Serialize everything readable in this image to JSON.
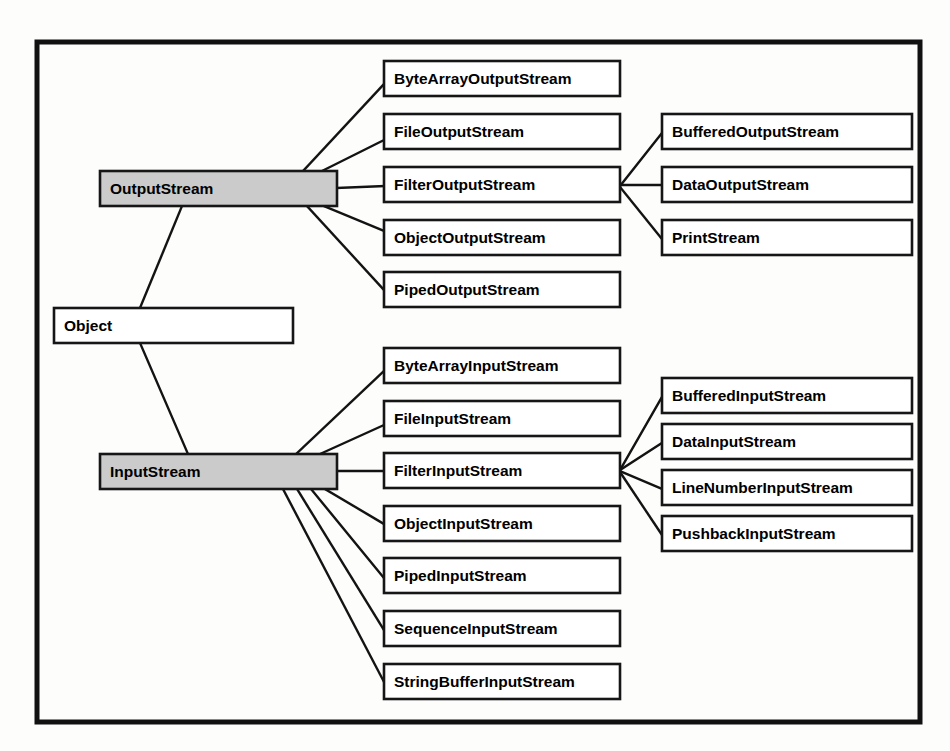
{
  "diagram": {
    "frame": {
      "x": 37,
      "y": 42,
      "width": 883,
      "height": 680
    },
    "colors": {
      "background": "#fdfdfc",
      "frame_border": "#111111",
      "node_border": "#161616",
      "node_fill": "#ffffff",
      "highlight_fill": "#cbcbcb",
      "edge": "#131313",
      "text": "#000000"
    },
    "nodes": [
      {
        "id": "object",
        "label": "Object",
        "x": 54,
        "y": 308,
        "w": 239,
        "h": 35,
        "highlight": false
      },
      {
        "id": "output_stream",
        "label": "OutputStream",
        "x": 100,
        "y": 171,
        "w": 237,
        "h": 35,
        "highlight": true
      },
      {
        "id": "input_stream",
        "label": "InputStream",
        "x": 100,
        "y": 454,
        "w": 237,
        "h": 35,
        "highlight": true
      },
      {
        "id": "byte_array_output_stream",
        "label": "ByteArrayOutputStream",
        "x": 384,
        "y": 61,
        "w": 236,
        "h": 35,
        "highlight": false
      },
      {
        "id": "file_output_stream",
        "label": "FileOutputStream",
        "x": 384,
        "y": 114,
        "w": 236,
        "h": 35,
        "highlight": false
      },
      {
        "id": "filter_output_stream",
        "label": "FilterOutputStream",
        "x": 384,
        "y": 167,
        "w": 236,
        "h": 35,
        "highlight": false
      },
      {
        "id": "object_output_stream",
        "label": "ObjectOutputStream",
        "x": 384,
        "y": 220,
        "w": 236,
        "h": 35,
        "highlight": false
      },
      {
        "id": "piped_output_stream",
        "label": "PipedOutputStream",
        "x": 384,
        "y": 272,
        "w": 236,
        "h": 35,
        "highlight": false
      },
      {
        "id": "buffered_output_stream",
        "label": "BufferedOutputStream",
        "x": 662,
        "y": 114,
        "w": 250,
        "h": 35,
        "highlight": false
      },
      {
        "id": "data_output_stream",
        "label": "DataOutputStream",
        "x": 662,
        "y": 167,
        "w": 250,
        "h": 35,
        "highlight": false
      },
      {
        "id": "print_stream",
        "label": "PrintStream",
        "x": 662,
        "y": 220,
        "w": 250,
        "h": 35,
        "highlight": false
      },
      {
        "id": "byte_array_input_stream",
        "label": "ByteArrayInputStream",
        "x": 384,
        "y": 348,
        "w": 236,
        "h": 35,
        "highlight": false
      },
      {
        "id": "file_input_stream",
        "label": "FileInputStream",
        "x": 384,
        "y": 401,
        "w": 236,
        "h": 35,
        "highlight": false
      },
      {
        "id": "filter_input_stream",
        "label": "FilterInputStream",
        "x": 384,
        "y": 453,
        "w": 236,
        "h": 35,
        "highlight": false
      },
      {
        "id": "object_input_stream",
        "label": "ObjectInputStream",
        "x": 384,
        "y": 506,
        "w": 236,
        "h": 35,
        "highlight": false
      },
      {
        "id": "piped_input_stream",
        "label": "PipedInputStream",
        "x": 384,
        "y": 558,
        "w": 236,
        "h": 35,
        "highlight": false
      },
      {
        "id": "sequence_input_stream",
        "label": "SequenceInputStream",
        "x": 384,
        "y": 611,
        "w": 236,
        "h": 35,
        "highlight": false
      },
      {
        "id": "string_buffer_input_stream",
        "label": "StringBufferInputStream",
        "x": 384,
        "y": 664,
        "w": 236,
        "h": 35,
        "highlight": false
      },
      {
        "id": "buffered_input_stream",
        "label": "BufferedInputStream",
        "x": 662,
        "y": 378,
        "w": 250,
        "h": 35,
        "highlight": false
      },
      {
        "id": "data_input_stream",
        "label": "DataInputStream",
        "x": 662,
        "y": 424,
        "w": 250,
        "h": 35,
        "highlight": false
      },
      {
        "id": "line_number_input_stream",
        "label": "LineNumberInputStream",
        "x": 662,
        "y": 470,
        "w": 250,
        "h": 35,
        "highlight": false
      },
      {
        "id": "pushback_input_stream",
        "label": "PushbackInputStream",
        "x": 662,
        "y": 516,
        "w": 250,
        "h": 35,
        "highlight": false
      }
    ],
    "edges": [
      {
        "id": "object-output_stream",
        "from": "object",
        "to": "output_stream",
        "x1": 140,
        "y1": 308,
        "x2": 182,
        "y2": 206
      },
      {
        "id": "object-input_stream",
        "from": "object",
        "to": "input_stream",
        "x1": 140,
        "y1": 343,
        "x2": 188,
        "y2": 454
      },
      {
        "id": "output_stream-byte_array_output_stream",
        "from": "output_stream",
        "to": "byte_array_output_stream",
        "x1": 303,
        "y1": 171,
        "x2": 384,
        "y2": 84
      },
      {
        "id": "output_stream-file_output_stream",
        "from": "output_stream",
        "to": "file_output_stream",
        "x1": 322,
        "y1": 171,
        "x2": 384,
        "y2": 140
      },
      {
        "id": "output_stream-filter_output_stream",
        "from": "output_stream",
        "to": "filter_output_stream",
        "x1": 337,
        "y1": 188,
        "x2": 384,
        "y2": 186
      },
      {
        "id": "output_stream-object_output_stream",
        "from": "output_stream",
        "to": "object_output_stream",
        "x1": 324,
        "y1": 206,
        "x2": 384,
        "y2": 231
      },
      {
        "id": "output_stream-piped_output_stream",
        "from": "output_stream",
        "to": "piped_output_stream",
        "x1": 307,
        "y1": 206,
        "x2": 384,
        "y2": 290
      },
      {
        "id": "filter_output_stream-buffered_output_stream",
        "from": "filter_output_stream",
        "to": "buffered_output_stream",
        "x1": 620,
        "y1": 186,
        "x2": 662,
        "y2": 133
      },
      {
        "id": "filter_output_stream-data_output_stream",
        "from": "filter_output_stream",
        "to": "data_output_stream",
        "x1": 620,
        "y1": 185,
        "x2": 662,
        "y2": 185
      },
      {
        "id": "filter_output_stream-print_stream",
        "from": "filter_output_stream",
        "to": "print_stream",
        "x1": 620,
        "y1": 187,
        "x2": 662,
        "y2": 239
      },
      {
        "id": "input_stream-byte_array_input_stream",
        "from": "input_stream",
        "to": "byte_array_input_stream",
        "x1": 296,
        "y1": 454,
        "x2": 384,
        "y2": 371
      },
      {
        "id": "input_stream-file_input_stream",
        "from": "input_stream",
        "to": "file_input_stream",
        "x1": 320,
        "y1": 454,
        "x2": 384,
        "y2": 425
      },
      {
        "id": "input_stream-filter_input_stream",
        "from": "input_stream",
        "to": "filter_input_stream",
        "x1": 337,
        "y1": 471,
        "x2": 384,
        "y2": 471
      },
      {
        "id": "input_stream-object_input_stream",
        "from": "input_stream",
        "to": "object_input_stream",
        "x1": 325,
        "y1": 489,
        "x2": 384,
        "y2": 524
      },
      {
        "id": "input_stream-piped_input_stream",
        "from": "input_stream",
        "to": "piped_input_stream",
        "x1": 311,
        "y1": 489,
        "x2": 384,
        "y2": 578
      },
      {
        "id": "input_stream-sequence_input_stream",
        "from": "input_stream",
        "to": "sequence_input_stream",
        "x1": 297,
        "y1": 489,
        "x2": 384,
        "y2": 630
      },
      {
        "id": "input_stream-string_buffer_input_stream",
        "from": "input_stream",
        "to": "string_buffer_input_stream",
        "x1": 283,
        "y1": 489,
        "x2": 384,
        "y2": 682
      },
      {
        "id": "filter_input_stream-buffered_input_stream",
        "from": "filter_input_stream",
        "to": "buffered_input_stream",
        "x1": 620,
        "y1": 470,
        "x2": 662,
        "y2": 397
      },
      {
        "id": "filter_input_stream-data_input_stream",
        "from": "filter_input_stream",
        "to": "data_input_stream",
        "x1": 620,
        "y1": 470,
        "x2": 662,
        "y2": 443
      },
      {
        "id": "filter_input_stream-line_number_input_stream",
        "from": "filter_input_stream",
        "to": "line_number_input_stream",
        "x1": 620,
        "y1": 471,
        "x2": 662,
        "y2": 489
      },
      {
        "id": "filter_input_stream-pushback_input_stream",
        "from": "filter_input_stream",
        "to": "pushback_input_stream",
        "x1": 620,
        "y1": 472,
        "x2": 662,
        "y2": 535
      }
    ]
  }
}
